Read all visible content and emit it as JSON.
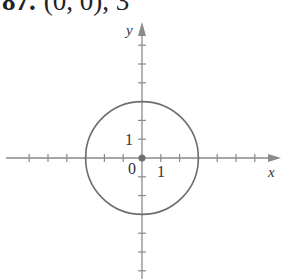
{
  "problem": {
    "number": "87.",
    "text": "(0, 0), 3"
  },
  "chart_data": {
    "type": "scatter",
    "title": "87. (0, 0), 3",
    "xlabel": "x",
    "ylabel": "y",
    "tick_labels": {
      "x": [
        "1"
      ],
      "y": [
        "1"
      ],
      "origin": "0"
    },
    "xlim": [
      -7,
      7
    ],
    "ylim": [
      -6,
      7
    ],
    "grid": false,
    "shapes": [
      {
        "type": "circle",
        "center": [
          0,
          0
        ],
        "radius": 3
      }
    ],
    "points": [
      {
        "x": 0,
        "y": 0,
        "label": "center"
      }
    ],
    "x_ticks": [
      -6,
      -5,
      -4,
      -3,
      -2,
      -1,
      1,
      2,
      3,
      4,
      5,
      6
    ],
    "y_ticks": [
      -6,
      -5,
      -4,
      -3,
      -2,
      -1,
      1,
      2,
      3,
      4,
      5,
      6
    ]
  },
  "colors": {
    "axis": "#8a8a8a",
    "circle": "#6e6e6e",
    "point": "#6e6e6e",
    "text": "#333333"
  }
}
